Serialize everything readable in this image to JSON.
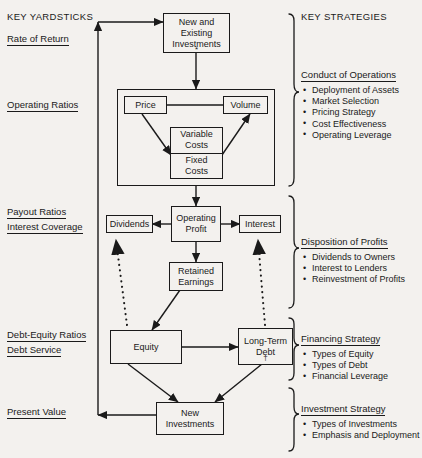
{
  "page": {
    "background": "#f3f1ee",
    "ink": "#1a1a1a"
  },
  "left_column": {
    "heading": "KEY YARDSTICKS",
    "groups": [
      {
        "labels": [
          "Rate of Return"
        ]
      },
      {
        "labels": [
          "Operating Ratios"
        ]
      },
      {
        "labels": [
          "Payout Ratios",
          "Interest Coverage"
        ]
      },
      {
        "labels": [
          "Debt-Equity Ratios",
          "Debt Service"
        ]
      },
      {
        "labels": [
          "Present Value"
        ]
      }
    ]
  },
  "right_column": {
    "heading": "KEY STRATEGIES",
    "sections": [
      {
        "title": "Conduct of Operations",
        "items": [
          "Deployment of Assets",
          "Market Selection",
          "Pricing Strategy",
          "Cost Effectiveness",
          "Operating Leverage"
        ]
      },
      {
        "title": "Disposition of Profits",
        "items": [
          "Dividends to Owners",
          "Interest to Lenders",
          "Reinvestment of Profits"
        ]
      },
      {
        "title": "Financing Strategy",
        "items": [
          "Types of Equity",
          "Types of Debt",
          "Financial Leverage"
        ]
      },
      {
        "title": "Investment Strategy",
        "items": [
          "Types of Investments",
          "Emphasis and Deployment"
        ]
      }
    ]
  },
  "nodes": {
    "new_existing_investments": {
      "line1": "New and",
      "line2": "Existing",
      "line3": "Investments",
      "marker": "*"
    },
    "price": {
      "label": "Price"
    },
    "volume": {
      "label": "Volume"
    },
    "variable_costs": {
      "line1": "Variable",
      "line2": "Costs"
    },
    "fixed_costs": {
      "line1": "Fixed",
      "line2": "Costs"
    },
    "operating_profit": {
      "line1": "Operating",
      "line2": "Profit"
    },
    "dividends": {
      "label": "Dividends"
    },
    "interest": {
      "label": "Interest"
    },
    "retained_earnings": {
      "line1": "Retained",
      "line2": "Earnings"
    },
    "equity": {
      "label": "Equity"
    },
    "long_term_debt": {
      "line1": "Long-Term",
      "line2": "Debt",
      "marker": "†"
    },
    "new_investments": {
      "line1": "New",
      "line2": "Investments"
    }
  }
}
